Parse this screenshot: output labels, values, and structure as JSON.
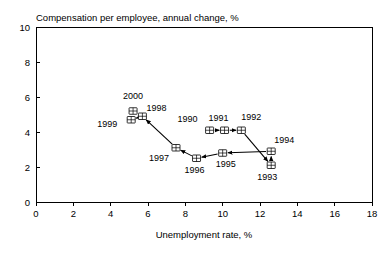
{
  "chart_data": {
    "type": "scatter",
    "title": "Compensation per employee, annual change, %",
    "xlabel": "Unemployment rate, %",
    "ylabel": "",
    "xlim": [
      0,
      18
    ],
    "ylim": [
      0,
      10
    ],
    "xticks": [
      "0",
      "2",
      "4",
      "6",
      "8",
      "10",
      "12",
      "14",
      "16",
      "18"
    ],
    "yticks": [
      "0",
      "2",
      "4",
      "6",
      "8",
      "10"
    ],
    "grid": false,
    "legend": "none",
    "connected": true,
    "annotation_note": "Points connected by arrows in chronological order 1990 through 2000",
    "points": [
      {
        "label": "1990",
        "x": 9.3,
        "y": 4.1,
        "label_dx": -22,
        "label_dy": -8
      },
      {
        "label": "1991",
        "x": 10.1,
        "y": 4.1,
        "label_dx": -6,
        "label_dy": -9
      },
      {
        "label": "1992",
        "x": 11.0,
        "y": 4.1,
        "label_dx": 10,
        "label_dy": -10
      },
      {
        "label": "1993",
        "x": 12.6,
        "y": 2.1,
        "label_dx": -4,
        "label_dy": 15
      },
      {
        "label": "1994",
        "x": 12.6,
        "y": 2.9,
        "label_dx": 13,
        "label_dy": -8
      },
      {
        "label": "1995",
        "x": 10.0,
        "y": 2.8,
        "label_dx": 3,
        "label_dy": 14
      },
      {
        "label": "1996",
        "x": 8.6,
        "y": 2.5,
        "label_dx": -2,
        "label_dy": 15
      },
      {
        "label": "1997",
        "x": 7.5,
        "y": 3.1,
        "label_dx": -17,
        "label_dy": 13
      },
      {
        "label": "1998",
        "x": 5.7,
        "y": 4.9,
        "label_dx": 14,
        "label_dy": -5
      },
      {
        "label": "1999",
        "x": 5.1,
        "y": 4.7,
        "label_dx": -24,
        "label_dy": 7
      },
      {
        "label": "2000",
        "x": 5.2,
        "y": 5.2,
        "label_dx": 0,
        "label_dy": -12
      }
    ]
  }
}
